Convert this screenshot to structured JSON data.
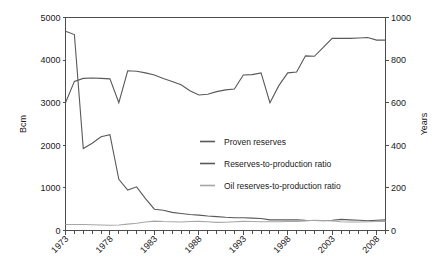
{
  "chart_data": {
    "type": "line",
    "title": "",
    "xlabel": "",
    "ylabel": "Bcm",
    "y2label": "Years",
    "xlim": [
      1973,
      2009
    ],
    "ylim": [
      0,
      5000
    ],
    "y2lim": [
      0,
      1000
    ],
    "grid": false,
    "legend_position": "center",
    "x": [
      1973,
      1974,
      1975,
      1976,
      1977,
      1978,
      1979,
      1980,
      1981,
      1982,
      1983,
      1984,
      1985,
      1986,
      1987,
      1988,
      1989,
      1990,
      1991,
      1992,
      1993,
      1994,
      1995,
      1996,
      1997,
      1998,
      1999,
      2000,
      2001,
      2002,
      2003,
      2004,
      2005,
      2006,
      2007,
      2008,
      2009
    ],
    "xticks": [
      1973,
      1978,
      1983,
      1988,
      1993,
      1998,
      2003,
      2008
    ],
    "xticklabels": [
      "1973",
      "1978",
      "1983",
      "1988",
      "1993",
      "1998",
      "2003",
      "2008"
    ],
    "yticks": [
      0,
      1000,
      2000,
      3000,
      4000,
      5000
    ],
    "yticklabels": [
      "0",
      "1000",
      "2000",
      "3000",
      "4000",
      "5000"
    ],
    "y2ticks": [
      0,
      200,
      400,
      600,
      800,
      1000
    ],
    "y2ticklabels": [
      "0",
      "200",
      "400",
      "600",
      "800",
      "1000"
    ],
    "series": [
      {
        "name": "Proven reserves",
        "axis": "left",
        "unit": "Bcm",
        "color": "#595959",
        "values": [
          3000,
          3500,
          3570,
          3580,
          3570,
          3560,
          3000,
          3750,
          3740,
          3700,
          3650,
          3570,
          3500,
          3420,
          3280,
          3180,
          3200,
          3260,
          3300,
          3320,
          3650,
          3660,
          3700,
          3000,
          3400,
          3700,
          3720,
          4100,
          4090,
          4300,
          4510,
          4510,
          4510,
          4520,
          4530,
          4470,
          4470
        ]
      },
      {
        "name": "Reserves-to-production ratio",
        "axis": "right",
        "unit": "Years",
        "color": "#595959",
        "values": [
          935,
          920,
          385,
          410,
          440,
          450,
          240,
          190,
          205,
          150,
          100,
          95,
          85,
          80,
          75,
          72,
          68,
          65,
          62,
          60,
          60,
          58,
          56,
          50,
          50,
          50,
          50,
          48,
          47,
          46,
          48,
          52,
          50,
          48,
          46,
          48,
          50
        ]
      },
      {
        "name": "Oil reserves-to-production ratio",
        "axis": "right",
        "unit": "Years",
        "color": "#a6a6a6",
        "values": [
          28,
          28,
          28,
          27,
          26,
          25,
          26,
          30,
          34,
          40,
          44,
          42,
          41,
          40,
          42,
          43,
          41,
          38,
          39,
          41,
          43,
          42,
          41,
          41,
          41,
          42,
          43,
          45,
          48,
          47,
          45,
          41,
          40,
          40,
          41,
          42,
          43
        ]
      }
    ]
  },
  "legend": {
    "items": [
      {
        "label": "Proven reserves",
        "color": "#595959"
      },
      {
        "label": "Reserves-to-production ratio",
        "color": "#595959"
      },
      {
        "label": "Oil reserves-to-production ratio",
        "color": "#a6a6a6"
      }
    ]
  }
}
